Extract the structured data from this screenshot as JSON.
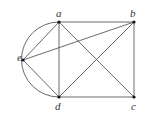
{
  "diagram": {
    "type": "graph",
    "nodes": [
      {
        "id": "a",
        "label": "a",
        "x": 59,
        "y": 22,
        "lx": 56,
        "ly": 17
      },
      {
        "id": "b",
        "label": "b",
        "x": 134,
        "y": 22,
        "lx": 130,
        "ly": 17
      },
      {
        "id": "c",
        "label": "c",
        "x": 134,
        "y": 97,
        "lx": 131,
        "ly": 110
      },
      {
        "id": "d",
        "label": "d",
        "x": 59,
        "y": 97,
        "lx": 55,
        "ly": 110
      },
      {
        "id": "e",
        "label": "e",
        "x": 23,
        "y": 60,
        "lx": 17,
        "ly": 61
      }
    ],
    "edges": [
      [
        "a",
        "b"
      ],
      [
        "a",
        "d"
      ],
      [
        "a",
        "e"
      ],
      [
        "a",
        "c"
      ],
      [
        "b",
        "e"
      ],
      [
        "b",
        "c"
      ],
      [
        "b",
        "d"
      ],
      [
        "d",
        "c"
      ],
      [
        "d",
        "e"
      ]
    ],
    "curved_edges": [
      {
        "from": "a",
        "to": "d",
        "side": "left"
      }
    ],
    "colors": {
      "edge": "#444444",
      "node": "#111111",
      "label": "#333333"
    }
  }
}
